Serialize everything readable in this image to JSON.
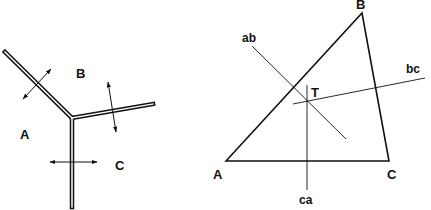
{
  "left_figure": {
    "title": "Triple junction of grain boundaries",
    "regions": {
      "a": "A",
      "b": "B",
      "c": "C"
    },
    "boundaries": [
      {
        "from": [
          5,
          52
        ],
        "to": [
          72,
          118
        ]
      },
      {
        "from": [
          72,
          118
        ],
        "to": [
          153,
          104
        ]
      },
      {
        "from": [
          72,
          118
        ],
        "to": [
          72,
          207
        ]
      }
    ],
    "arrows": [
      {
        "from": [
          23,
          99
        ],
        "to": [
          51,
          69
        ]
      },
      {
        "from": [
          108,
          82
        ],
        "to": [
          116,
          132
        ]
      },
      {
        "from": [
          50,
          162
        ],
        "to": [
          97,
          162
        ]
      }
    ]
  },
  "right_figure": {
    "title": "Triangle with perpendicular bisectors",
    "vertices": {
      "a": {
        "label": "A",
        "point": [
          226,
          161
        ]
      },
      "b": {
        "label": "B",
        "point": [
          362,
          13
        ]
      },
      "c": {
        "label": "C",
        "point": [
          389,
          161
        ]
      }
    },
    "bisectors": {
      "ab": {
        "label": "ab",
        "from": [
          252,
          46
        ],
        "to": [
          346,
          139
        ]
      },
      "bc": {
        "label": "bc",
        "from": [
          293,
          104
        ],
        "to": [
          425,
          78
        ]
      },
      "ca": {
        "label": "ca",
        "from": [
          307,
          85
        ],
        "to": [
          307,
          190
        ]
      }
    },
    "intersection": {
      "label": "T",
      "point": [
        307,
        101
      ]
    }
  },
  "colors": {
    "stroke": "#111111",
    "background": "#ffffff"
  }
}
